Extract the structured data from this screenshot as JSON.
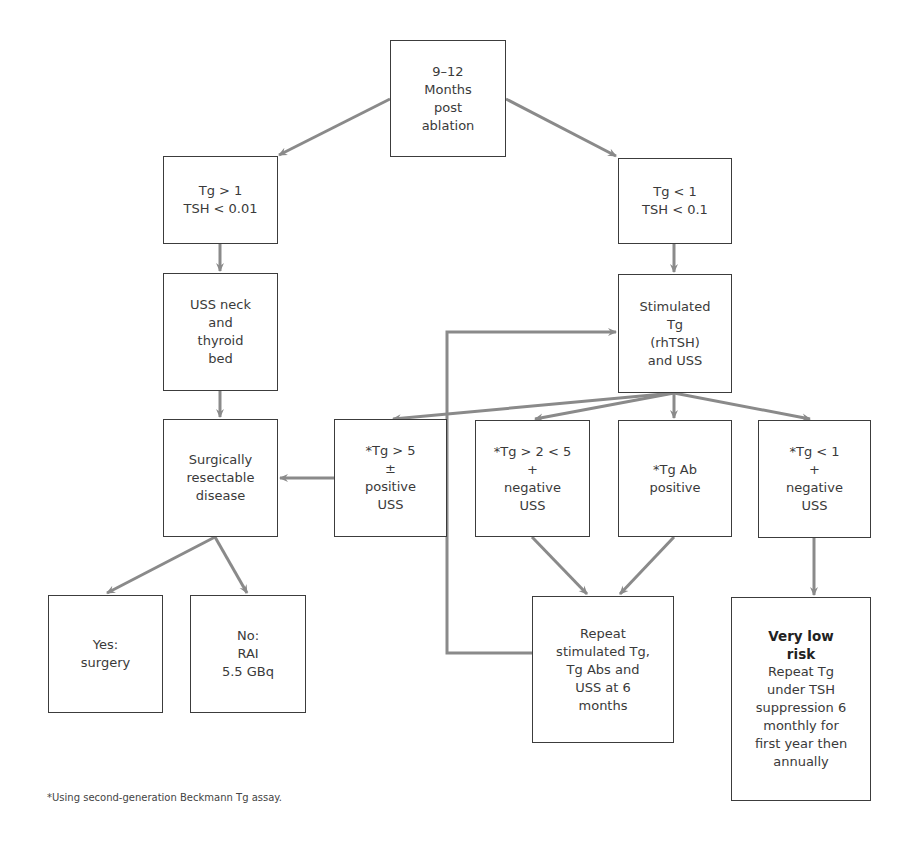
{
  "diagram": {
    "type": "flowchart",
    "line_color": "#8a8a8a",
    "border_color": "#3c3c3c",
    "nodes": {
      "start": {
        "lines": [
          "9–12",
          "Months",
          "post",
          "ablation"
        ]
      },
      "tg_high": {
        "lines": [
          "Tg > 1",
          "TSH < 0.01"
        ]
      },
      "tg_low": {
        "lines": [
          "Tg < 1",
          "TSH < 0.1"
        ]
      },
      "uss_neck": {
        "lines": [
          "USS neck",
          "and",
          "thyroid",
          "bed"
        ]
      },
      "stimulated": {
        "lines": [
          "Stimulated",
          "Tg",
          "(rhTSH)",
          "and USS"
        ]
      },
      "resectable": {
        "lines": [
          "Surgically",
          "resectable",
          "disease"
        ]
      },
      "tg_gt5": {
        "lines": [
          "*Tg > 5",
          "±",
          "positive",
          "USS"
        ]
      },
      "tg_2_5": {
        "lines": [
          "*Tg > 2 < 5",
          "+",
          "negative",
          "USS"
        ]
      },
      "tgab": {
        "lines": [
          "*Tg Ab",
          "positive"
        ]
      },
      "tg_lt1": {
        "lines": [
          "*Tg < 1",
          "+",
          "negative",
          "USS"
        ]
      },
      "yes_surgery": {
        "lines": [
          "Yes:",
          "surgery"
        ]
      },
      "no_rai": {
        "lines": [
          "No:",
          "RAI",
          "5.5 GBq"
        ]
      },
      "repeat": {
        "lines": [
          "Repeat",
          "stimulated Tg,",
          "Tg Abs and",
          "USS at 6",
          "months"
        ]
      },
      "very_low": {
        "title_lines": [
          "Very low",
          "risk"
        ],
        "lines": [
          "Repeat Tg",
          "under TSH",
          "suppression 6",
          "monthly for",
          "first year then",
          "annually"
        ]
      }
    },
    "edges": [
      {
        "from": "start",
        "to": "tg_high"
      },
      {
        "from": "start",
        "to": "tg_low"
      },
      {
        "from": "tg_high",
        "to": "uss_neck"
      },
      {
        "from": "tg_low",
        "to": "stimulated"
      },
      {
        "from": "uss_neck",
        "to": "resectable"
      },
      {
        "from": "stimulated",
        "to": "tg_gt5"
      },
      {
        "from": "stimulated",
        "to": "tg_2_5"
      },
      {
        "from": "stimulated",
        "to": "tgab"
      },
      {
        "from": "stimulated",
        "to": "tg_lt1"
      },
      {
        "from": "tg_gt5",
        "to": "resectable"
      },
      {
        "from": "resectable",
        "to": "yes_surgery"
      },
      {
        "from": "resectable",
        "to": "no_rai"
      },
      {
        "from": "tg_2_5",
        "to": "repeat"
      },
      {
        "from": "tgab",
        "to": "repeat"
      },
      {
        "from": "tg_lt1",
        "to": "very_low"
      },
      {
        "from": "repeat",
        "to": "stimulated"
      }
    ]
  },
  "footnote": "*Using second-generation Beckmann Tg assay."
}
